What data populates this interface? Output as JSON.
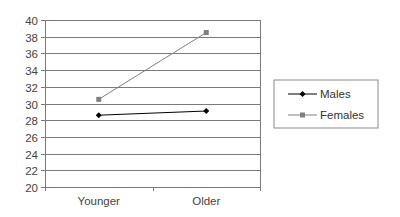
{
  "chart_data": {
    "type": "line",
    "title": "",
    "xlabel": "",
    "ylabel": "",
    "categories": [
      "Younger",
      "Older"
    ],
    "series": [
      {
        "name": "Males",
        "values": [
          28.6,
          29.1
        ],
        "color": "#000000",
        "marker": "diamond"
      },
      {
        "name": "Females",
        "values": [
          30.5,
          38.5
        ],
        "color": "#808080",
        "marker": "square"
      }
    ],
    "ylim": [
      20,
      40
    ],
    "yticks": [
      20,
      22,
      24,
      26,
      28,
      30,
      32,
      34,
      36,
      38,
      40
    ],
    "grid": true,
    "legend_position": "right"
  },
  "legend": {
    "items": [
      {
        "label": "Males"
      },
      {
        "label": "Females"
      }
    ]
  }
}
